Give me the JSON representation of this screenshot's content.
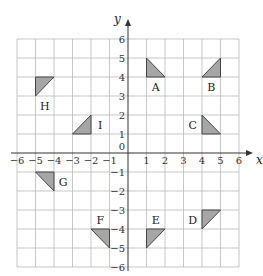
{
  "axes": {
    "x_label": "x",
    "y_label": "y",
    "x_range": [
      -6,
      6
    ],
    "y_range": [
      -6,
      6
    ],
    "x_ticks": [
      "-6",
      "-5",
      "-4",
      "-3",
      "-2",
      "-1",
      "1",
      "2",
      "3",
      "4",
      "5",
      "6"
    ],
    "y_ticks": [
      "6",
      "5",
      "4",
      "3",
      "2",
      "1",
      "-1",
      "-2",
      "-3",
      "-4",
      "-5",
      "-6"
    ],
    "origin_label": "0"
  },
  "colors": {
    "shape_fill": "#a6a6a6",
    "grid": "#b9b9b9",
    "axis": "#333333"
  },
  "shapes": [
    {
      "label": "A",
      "vertices": [
        [
          1,
          5
        ],
        [
          1,
          4
        ],
        [
          2,
          4
        ]
      ],
      "label_pos": [
        1.5,
        3.5
      ]
    },
    {
      "label": "B",
      "vertices": [
        [
          4,
          4
        ],
        [
          5,
          4
        ],
        [
          5,
          5
        ]
      ],
      "label_pos": [
        4.5,
        3.5
      ]
    },
    {
      "label": "C",
      "vertices": [
        [
          4,
          2
        ],
        [
          4,
          1
        ],
        [
          5,
          1
        ]
      ],
      "label_pos": [
        3.5,
        1.5
      ]
    },
    {
      "label": "D",
      "vertices": [
        [
          4,
          -3
        ],
        [
          5,
          -3
        ],
        [
          4,
          -4
        ]
      ],
      "label_pos": [
        3.5,
        -3.5
      ]
    },
    {
      "label": "E",
      "vertices": [
        [
          1,
          -4
        ],
        [
          2,
          -4
        ],
        [
          1,
          -5
        ]
      ],
      "label_pos": [
        1.5,
        -3.5
      ]
    },
    {
      "label": "F",
      "vertices": [
        [
          -2,
          -4
        ],
        [
          -1,
          -4
        ],
        [
          -1,
          -5
        ]
      ],
      "label_pos": [
        -1.5,
        -3.5
      ]
    },
    {
      "label": "G",
      "vertices": [
        [
          -5,
          -1
        ],
        [
          -4,
          -1
        ],
        [
          -4,
          -2
        ]
      ],
      "label_pos": [
        -3.5,
        -1.5
      ]
    },
    {
      "label": "H",
      "vertices": [
        [
          -5,
          4
        ],
        [
          -4,
          4
        ],
        [
          -5,
          3
        ]
      ],
      "label_pos": [
        -4.5,
        2.5
      ]
    },
    {
      "label": "I",
      "vertices": [
        [
          -3,
          1
        ],
        [
          -2,
          1
        ],
        [
          -2,
          2
        ]
      ],
      "label_pos": [
        -1.5,
        1.5
      ]
    }
  ]
}
